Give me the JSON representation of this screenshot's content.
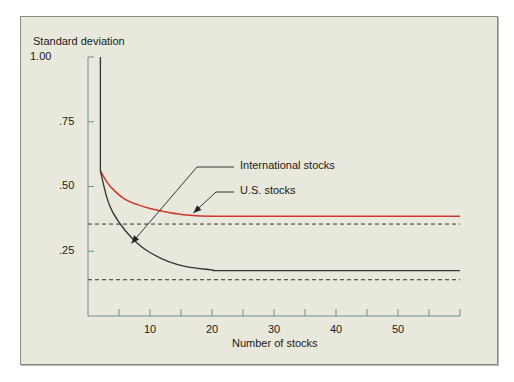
{
  "chart_data": {
    "type": "line",
    "title": "",
    "xlabel": "Number of stocks",
    "ylabel": "Standard deviation",
    "xlim": [
      0,
      60
    ],
    "ylim": [
      0,
      1.0
    ],
    "x_ticks": [
      5,
      10,
      15,
      20,
      25,
      30,
      35,
      40,
      45,
      50,
      55,
      60
    ],
    "x_tick_labels": [
      "10",
      "20",
      "30",
      "40",
      "50"
    ],
    "x_tick_label_positions": [
      10,
      20,
      30,
      40,
      50
    ],
    "y_ticks": [
      0.25,
      0.5,
      0.75,
      1.0
    ],
    "y_tick_labels": [
      ".25",
      ".50",
      ".75",
      "1.00"
    ],
    "grid": false,
    "series": [
      {
        "name": "U.S. stocks",
        "color": "#d0362b",
        "x": [
          2,
          3,
          4,
          6,
          8,
          10,
          13,
          16,
          20,
          30,
          40,
          50,
          60
        ],
        "y": [
          0.56,
          0.52,
          0.49,
          0.45,
          0.43,
          0.415,
          0.4,
          0.39,
          0.385,
          0.385,
          0.385,
          0.385,
          0.385
        ]
      },
      {
        "name": "International stocks",
        "color": "#333333",
        "x": [
          2,
          2,
          3,
          4,
          6,
          8,
          10,
          13,
          16,
          20,
          21,
          30,
          40,
          50,
          60
        ],
        "y": [
          1.0,
          0.56,
          0.46,
          0.4,
          0.33,
          0.28,
          0.245,
          0.21,
          0.19,
          0.178,
          0.175,
          0.175,
          0.175,
          0.175,
          0.175
        ]
      },
      {
        "name": "U.S. stocks asymptote",
        "style": "dashed",
        "color": "#333333",
        "x": [
          0,
          60
        ],
        "y": [
          0.355,
          0.355
        ]
      },
      {
        "name": "International stocks asymptote",
        "style": "dashed",
        "color": "#333333",
        "x": [
          0,
          60
        ],
        "y": [
          0.14,
          0.14
        ]
      }
    ],
    "annotations": [
      {
        "text": "International stocks",
        "arrow_to": [
          7,
          0.28
        ]
      },
      {
        "text": "U.S. stocks",
        "arrow_to": [
          17,
          0.39
        ]
      }
    ]
  },
  "labels": {
    "ylabel": "Standard deviation",
    "xlabel": "Number of stocks",
    "annotation_intl": "International stocks",
    "annotation_us": "U.S. stocks",
    "yticks": [
      ".25",
      ".50",
      ".75",
      "1.00"
    ],
    "xticks": [
      "10",
      "20",
      "30",
      "40",
      "50"
    ]
  }
}
